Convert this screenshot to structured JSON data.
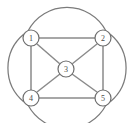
{
  "figure": {
    "name": "undirected-graph-diagram",
    "background_color": "#ffffff",
    "stroke_color": "#7b7b7b",
    "node_fill_color": "#ffffff",
    "node_stroke_color": "#6e6e6e",
    "label_color": "#4a4a4a",
    "width": 133,
    "height": 123
  },
  "nodes": [
    {
      "id": "1",
      "label": "1",
      "cx": 31,
      "cy": 38,
      "r": 8
    },
    {
      "id": "2",
      "label": "2",
      "cx": 103,
      "cy": 38,
      "r": 8
    },
    {
      "id": "3",
      "label": "3",
      "cx": 66,
      "cy": 69,
      "r": 8
    },
    {
      "id": "4",
      "label": "4",
      "cx": 31,
      "cy": 98,
      "r": 8
    },
    {
      "id": "5",
      "label": "5",
      "cx": 103,
      "cy": 98,
      "r": 8
    }
  ],
  "straight_edges": [
    {
      "id": "edge-1-2",
      "from": "1",
      "to": "2",
      "x1": 39,
      "y1": 38,
      "x2": 95,
      "y2": 38
    },
    {
      "id": "edge-1-4",
      "from": "1",
      "to": "4",
      "x1": 31,
      "y1": 46,
      "x2": 31,
      "y2": 90
    },
    {
      "id": "edge-2-5",
      "from": "2",
      "to": "5",
      "x1": 103,
      "y1": 46,
      "x2": 103,
      "y2": 90
    },
    {
      "id": "edge-4-5",
      "from": "4",
      "to": "5",
      "x1": 39,
      "y1": 98,
      "x2": 95,
      "y2": 98
    },
    {
      "id": "edge-1-3",
      "from": "1",
      "to": "3",
      "x1": 37,
      "y1": 44,
      "x2": 60,
      "y2": 64
    },
    {
      "id": "edge-2-3",
      "from": "2",
      "to": "3",
      "x1": 97,
      "y1": 44,
      "x2": 72,
      "y2": 64
    },
    {
      "id": "edge-4-3",
      "from": "4",
      "to": "3",
      "x1": 37,
      "y1": 92,
      "x2": 60,
      "y2": 74
    },
    {
      "id": "edge-5-3",
      "from": "5",
      "to": "3",
      "x1": 97,
      "y1": 92,
      "x2": 72,
      "y2": 74
    }
  ],
  "arc_edges": [
    {
      "id": "arc-1-2-top",
      "from": "1",
      "to": "2",
      "path": "M 28 31 A 44 44 0 0 1 106 31",
      "bulge": "up"
    },
    {
      "id": "arc-4-5-bottom",
      "from": "4",
      "to": "5",
      "path": "M 28 105 A 44 44 0 0 0 106 105",
      "bulge": "down"
    },
    {
      "id": "arc-1-4-left",
      "from": "1",
      "to": "4",
      "path": "M 24 34 A 44 44 0 0 0 24 102",
      "bulge": "left"
    },
    {
      "id": "arc-2-5-right",
      "from": "2",
      "to": "5",
      "path": "M 110 34 A 44 44 0 0 1 110 102",
      "bulge": "right"
    }
  ],
  "chart_data": {
    "type": "diagram",
    "title": "",
    "graph_kind": "undirected multigraph",
    "vertex_labels": [
      "1",
      "2",
      "3",
      "4",
      "5"
    ],
    "edges": [
      [
        "1",
        "2"
      ],
      [
        "1",
        "4"
      ],
      [
        "2",
        "5"
      ],
      [
        "4",
        "5"
      ],
      [
        "1",
        "3"
      ],
      [
        "2",
        "3"
      ],
      [
        "3",
        "4"
      ],
      [
        "3",
        "5"
      ],
      [
        "1",
        "2"
      ],
      [
        "4",
        "5"
      ],
      [
        "1",
        "4"
      ],
      [
        "2",
        "5"
      ]
    ]
  }
}
